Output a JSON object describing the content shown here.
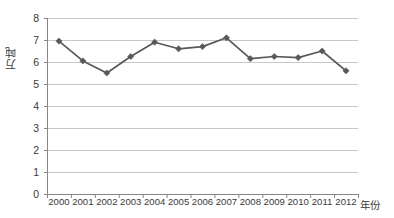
{
  "chart_data": {
    "type": "line",
    "title": "",
    "xlabel": "年份",
    "ylabel": "万吨",
    "ylim": [
      0,
      8
    ],
    "ytick_step": 1,
    "grid": true,
    "legend": "none",
    "marker": "diamond",
    "series_color": "#595959",
    "gridline_color": "#c8c8c8",
    "axis_color": "#868686",
    "categories": [
      "2000",
      "2001",
      "2002",
      "2003",
      "2004",
      "2005",
      "2006",
      "2007",
      "2008",
      "2009",
      "2010",
      "2011",
      "2012"
    ],
    "yticks": [
      "0",
      "1",
      "2",
      "3",
      "4",
      "5",
      "6",
      "7",
      "8"
    ],
    "series": [
      {
        "name": "",
        "values": [
          6.95,
          6.05,
          5.5,
          6.25,
          6.9,
          6.6,
          6.7,
          7.1,
          6.15,
          6.25,
          6.2,
          6.5,
          5.6
        ]
      }
    ]
  }
}
